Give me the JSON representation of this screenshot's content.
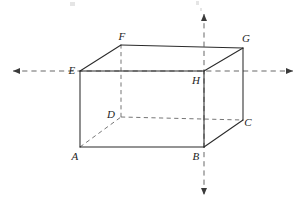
{
  "figure": {
    "kind": "geometry-diagram",
    "width": 302,
    "height": 206,
    "background_color": "#ffffff",
    "solid_edge_color": "#2b2b2b",
    "hidden_edge_color": "#6f6f6f",
    "axis_color": "#5f5f5f",
    "label_color": "#1d1d1d"
  },
  "vertices": [
    {
      "id": "A",
      "label": "A",
      "x": 80,
      "y": 147,
      "label_x": 75,
      "label_y": 156,
      "hidden": false
    },
    {
      "id": "B",
      "label": "B",
      "x": 204,
      "y": 147,
      "label_x": 196,
      "label_y": 156,
      "hidden": false
    },
    {
      "id": "C",
      "label": "C",
      "x": 243,
      "y": 120,
      "label_x": 248,
      "label_y": 122,
      "hidden": false
    },
    {
      "id": "D",
      "label": "D",
      "x": 121,
      "y": 117,
      "label_x": 111,
      "label_y": 114,
      "hidden": true
    },
    {
      "id": "E",
      "label": "E",
      "x": 80,
      "y": 71,
      "label_x": 72,
      "label_y": 70,
      "hidden": false
    },
    {
      "id": "F",
      "label": "F",
      "x": 121,
      "y": 45,
      "label_x": 122,
      "label_y": 36,
      "hidden": false
    },
    {
      "id": "G",
      "label": "G",
      "x": 243,
      "y": 48,
      "label_x": 246,
      "label_y": 38,
      "hidden": false
    },
    {
      "id": "H",
      "label": "H",
      "x": 204,
      "y": 71,
      "label_x": 196,
      "label_y": 80,
      "hidden": false
    }
  ],
  "edges": [
    {
      "from": "A",
      "to": "B",
      "style": "solid"
    },
    {
      "from": "A",
      "to": "E",
      "style": "solid"
    },
    {
      "from": "B",
      "to": "C",
      "style": "solid"
    },
    {
      "from": "B",
      "to": "H",
      "style": "solid"
    },
    {
      "from": "C",
      "to": "G",
      "style": "solid"
    },
    {
      "from": "E",
      "to": "F",
      "style": "solid"
    },
    {
      "from": "E",
      "to": "H",
      "style": "solid"
    },
    {
      "from": "F",
      "to": "G",
      "style": "solid"
    },
    {
      "from": "G",
      "to": "H",
      "style": "solid"
    },
    {
      "from": "A",
      "to": "D",
      "style": "dashed"
    },
    {
      "from": "D",
      "to": "C",
      "style": "dashed"
    },
    {
      "from": "D",
      "to": "F",
      "style": "dashed"
    }
  ],
  "axes": [
    {
      "id": "horizontal-axis",
      "orientation": "horizontal",
      "x1": 13,
      "y1": 71,
      "x2": 293,
      "y2": 71,
      "arrow_start": true,
      "arrow_end": true,
      "passes_through": [
        "E",
        "H"
      ]
    },
    {
      "id": "vertical-axis",
      "orientation": "vertical",
      "x1": 204,
      "y1": 14,
      "x2": 204,
      "y2": 195,
      "arrow_start": true,
      "arrow_end": true,
      "passes_through": [
        "H",
        "B"
      ]
    }
  ],
  "scan_specks": [
    {
      "x": 70,
      "y": 2,
      "w": 5,
      "h": 4
    },
    {
      "x": 196,
      "y": 1,
      "w": 3,
      "h": 4
    },
    {
      "x": 200,
      "y": 8,
      "w": 2,
      "h": 3
    }
  ]
}
